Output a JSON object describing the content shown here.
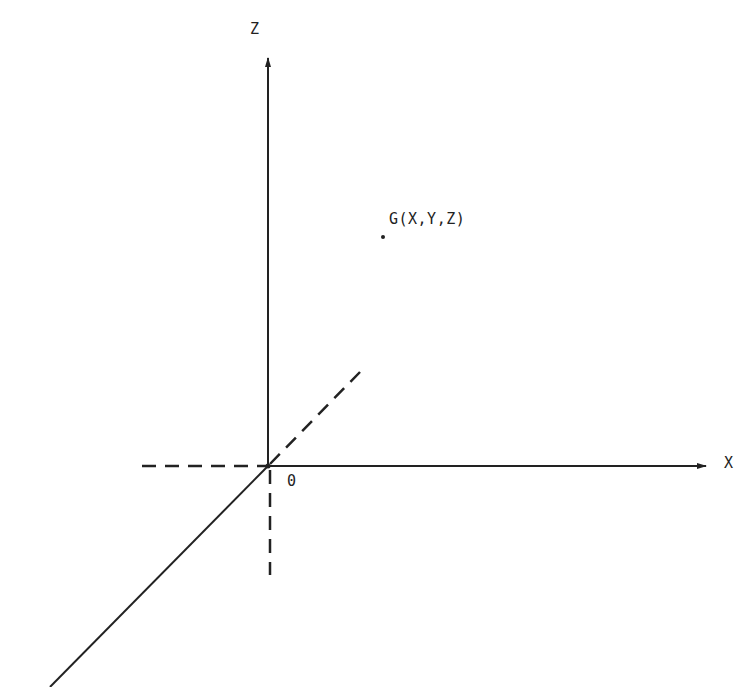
{
  "diagram": {
    "type": "3d-coordinate-axes",
    "axes": {
      "z": {
        "label": "Z",
        "direction": "up",
        "style": "solid",
        "arrow": true
      },
      "x": {
        "label": "X",
        "direction": "right",
        "style": "solid",
        "arrow": true
      },
      "y": {
        "label": "",
        "direction": "down-left (toward viewer)",
        "style": "solid",
        "arrow": false
      }
    },
    "negative_extensions": {
      "x_negative": "dashed",
      "z_negative": "dashed",
      "y_negative": "dashed"
    },
    "origin": {
      "label": "0"
    },
    "point": {
      "label": "G(X,Y,Z)",
      "marker": "dot"
    },
    "colors": {
      "line": "#222222",
      "background": "#ffffff"
    }
  }
}
